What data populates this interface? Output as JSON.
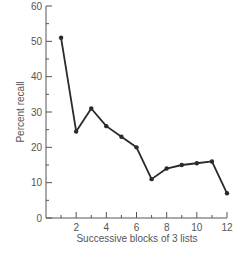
{
  "chart_data": {
    "type": "line",
    "title": "",
    "xlabel": "Successive blocks of 3 lists",
    "ylabel": "Percent recall",
    "x": [
      1,
      2,
      3,
      4,
      5,
      6,
      7,
      8,
      9,
      10,
      11,
      12
    ],
    "values": [
      51,
      24.5,
      31,
      26,
      23,
      20,
      11,
      14,
      15,
      15.5,
      16,
      7
    ],
    "xlim": [
      0,
      12
    ],
    "ylim": [
      0,
      60
    ],
    "x_ticks": [
      2,
      4,
      6,
      8,
      10,
      12
    ],
    "x_tick_labels": [
      "2",
      "4",
      "6",
      "8",
      "10",
      "12"
    ],
    "y_ticks": [
      0,
      10,
      20,
      30,
      40,
      50,
      60
    ],
    "y_tick_labels": [
      "0",
      "10",
      "20",
      "30",
      "40",
      "50",
      "60"
    ],
    "grid": false,
    "legend": null,
    "line_color": "#2a2a2a"
  }
}
